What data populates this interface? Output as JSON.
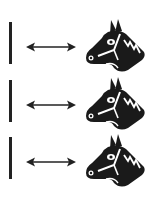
{
  "diagram": {
    "rows": [
      {
        "left": "vertical-line",
        "relation": "double-arrow",
        "right": "horse-head-icon"
      },
      {
        "left": "vertical-line",
        "relation": "double-arrow",
        "right": "horse-head-icon"
      },
      {
        "left": "vertical-line",
        "relation": "double-arrow",
        "right": "horse-head-icon"
      }
    ],
    "colors": {
      "ink": "#222222",
      "background": "#ffffff"
    }
  }
}
